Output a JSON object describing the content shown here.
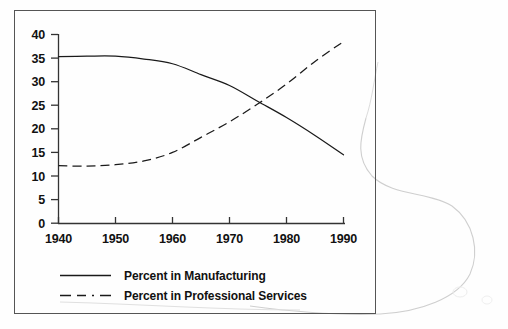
{
  "figure": {
    "frame_color": "#555555",
    "background": "#ffffff",
    "artifact_name": "scanner-page-curl-shadow"
  },
  "chart_data": {
    "type": "line",
    "title": "",
    "subtitle": "",
    "xlabel": "",
    "ylabel": "",
    "xlim": [
      1940,
      1990
    ],
    "ylim": [
      0,
      40
    ],
    "grid": false,
    "legend_position": "bottom",
    "x_ticks": [
      "1940",
      "1950",
      "1960",
      "1970",
      "1980",
      "1990"
    ],
    "y_ticks": [
      "0",
      "5",
      "10",
      "15",
      "20",
      "25",
      "30",
      "35",
      "40"
    ],
    "x": [
      1940,
      1945,
      1950,
      1955,
      1960,
      1965,
      1970,
      1975,
      1980,
      1985,
      1990
    ],
    "series": [
      {
        "name": "Percent in Manufacturing",
        "style": "solid",
        "color": "#1a1a1a",
        "values": [
          35.3,
          35.4,
          35.4,
          34.8,
          33.8,
          31.5,
          29.2,
          25.8,
          22.4,
          18.6,
          14.5
        ]
      },
      {
        "name": "Percent in Professional Services",
        "style": "dashed",
        "color": "#1a1a1a",
        "values": [
          12.2,
          12.1,
          12.4,
          13.2,
          15.0,
          18.2,
          21.5,
          25.3,
          29.5,
          34.3,
          38.5
        ]
      }
    ],
    "annotations": [
      {
        "name": "crossover",
        "x": 1973,
        "y": 26.5
      }
    ]
  },
  "legend": {
    "items": [
      {
        "label": "Percent in Manufacturing",
        "style": "solid"
      },
      {
        "label": "Percent in Professional Services",
        "style": "dashed"
      }
    ]
  }
}
